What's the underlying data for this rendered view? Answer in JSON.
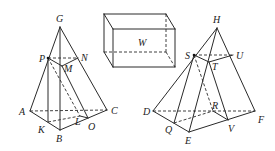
{
  "figure": {
    "left_solid": {
      "labels": {
        "G": "G",
        "P": "P",
        "N": "N",
        "M": "M",
        "A": "A",
        "K": "K",
        "B": "B",
        "C": "C",
        "L": "L",
        "O": "O"
      }
    },
    "box": {
      "labels": {
        "W": "W"
      }
    },
    "right_solid": {
      "labels": {
        "H": "H",
        "S": "S",
        "U": "U",
        "T": "T",
        "D": "D",
        "Q": "Q",
        "E": "E",
        "R": "R",
        "V": "V",
        "F": "F"
      }
    }
  },
  "colors": {
    "line": "#2a2a2a",
    "background": "#ffffff"
  }
}
